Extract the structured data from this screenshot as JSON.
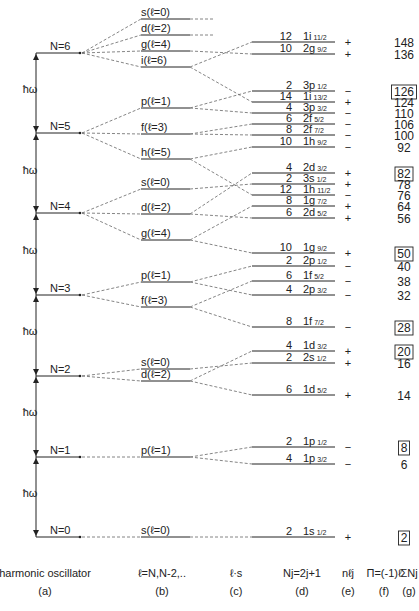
{
  "diagram": {
    "hbar_omega_label": "ħω",
    "oscillator_levels": [
      {
        "label": "N=6",
        "y": 53
      },
      {
        "label": "N=5",
        "y": 133
      },
      {
        "label": "N=4",
        "y": 213
      },
      {
        "label": "N=3",
        "y": 295
      },
      {
        "label": "N=2",
        "y": 376
      },
      {
        "label": "N=1",
        "y": 457
      },
      {
        "label": "N=0",
        "y": 537
      }
    ],
    "hbar_omega_label_positions": [
      93,
      174,
      254,
      335,
      416,
      497
    ],
    "l_levels": [
      {
        "N": 6,
        "label": "s(ℓ=0)",
        "y": 19
      },
      {
        "N": 6,
        "label": "d(ℓ=2)",
        "y": 35
      },
      {
        "N": 6,
        "label": "g(ℓ=4)",
        "y": 51
      },
      {
        "N": 6,
        "label": "i(ℓ=6)",
        "y": 67
      },
      {
        "N": 5,
        "label": "p(ℓ=1)",
        "y": 108
      },
      {
        "N": 5,
        "label": "f(ℓ=3)",
        "y": 134
      },
      {
        "N": 5,
        "label": "h(ℓ=5)",
        "y": 159
      },
      {
        "N": 4,
        "label": "s(ℓ=0)",
        "y": 189
      },
      {
        "N": 4,
        "label": "d(ℓ=2)",
        "y": 214
      },
      {
        "N": 4,
        "label": "g(ℓ=4)",
        "y": 240
      },
      {
        "N": 3,
        "label": "p(ℓ=1)",
        "y": 282
      },
      {
        "N": 3,
        "label": "f(ℓ=3)",
        "y": 307
      },
      {
        "N": 2,
        "label": "s(ℓ=0)",
        "y": 369
      },
      {
        "N": 2,
        "label": "d(ℓ=2)",
        "y": 381
      },
      {
        "N": 1,
        "label": "p(ℓ=1)",
        "y": 457
      },
      {
        "N": 0,
        "label": "s(ℓ=0)",
        "y": 537
      }
    ],
    "j_levels": [
      {
        "Nj": "12",
        "n": "1i",
        "j": "11/2",
        "parity": "+",
        "sum": "148",
        "magic": false,
        "y": 42,
        "from": 3
      },
      {
        "Nj": "10",
        "n": "2g",
        "j": "9/2",
        "parity": "+",
        "sum": "136",
        "magic": false,
        "y": 54,
        "from": 2
      },
      {
        "Nj": "2",
        "n": "3p",
        "j": "1/2",
        "parity": "−",
        "sum": "126",
        "magic": true,
        "y": 91,
        "from": 4
      },
      {
        "Nj": "14",
        "n": "1i",
        "j": "13/2",
        "parity": "+",
        "sum": "124",
        "magic": false,
        "y": 102,
        "from": 3
      },
      {
        "Nj": "4",
        "n": "3p",
        "j": "3/2",
        "parity": "−",
        "sum": "110",
        "magic": false,
        "y": 113,
        "from": 4
      },
      {
        "Nj": "6",
        "n": "2f",
        "j": "5/2",
        "parity": "−",
        "sum": "106",
        "magic": false,
        "y": 124,
        "from": 5
      },
      {
        "Nj": "8",
        "n": "2f",
        "j": "7/2",
        "parity": "−",
        "sum": "100",
        "magic": false,
        "y": 135,
        "from": 5
      },
      {
        "Nj": "10",
        "n": "1h",
        "j": "9/2",
        "parity": "−",
        "sum": "92",
        "magic": false,
        "y": 147,
        "from": 6
      },
      {
        "Nj": "4",
        "n": "2d",
        "j": "3/2",
        "parity": "+",
        "sum": "82",
        "magic": true,
        "y": 173,
        "from": 8
      },
      {
        "Nj": "2",
        "n": "3s",
        "j": "1/2",
        "parity": "+",
        "sum": "78",
        "magic": false,
        "y": 184,
        "from": 7
      },
      {
        "Nj": "12",
        "n": "1h",
        "j": "11/2",
        "parity": "−",
        "sum": "76",
        "magic": false,
        "y": 195,
        "from": 6
      },
      {
        "Nj": "8",
        "n": "1g",
        "j": "7/2",
        "parity": "+",
        "sum": "64",
        "magic": false,
        "y": 206,
        "from": 9
      },
      {
        "Nj": "6",
        "n": "2d",
        "j": "5/2",
        "parity": "+",
        "sum": "56",
        "magic": false,
        "y": 218,
        "from": 8
      },
      {
        "Nj": "10",
        "n": "1g",
        "j": "9/2",
        "parity": "+",
        "sum": "50",
        "magic": true,
        "y": 253,
        "from": 9
      },
      {
        "Nj": "2",
        "n": "2p",
        "j": "1/2",
        "parity": "−",
        "sum": "40",
        "magic": false,
        "y": 266,
        "from": 10
      },
      {
        "Nj": "6",
        "n": "1f",
        "j": "5/2",
        "parity": "−",
        "sum": "38",
        "magic": false,
        "y": 281,
        "from": 11
      },
      {
        "Nj": "4",
        "n": "2p",
        "j": "3/2",
        "parity": "−",
        "sum": "32",
        "magic": false,
        "y": 295,
        "from": 10
      },
      {
        "Nj": "8",
        "n": "1f",
        "j": "7/2",
        "parity": "−",
        "sum": "28",
        "magic": true,
        "y": 327,
        "from": 11
      },
      {
        "Nj": "4",
        "n": "1d",
        "j": "3/2",
        "parity": "+",
        "sum": "20",
        "magic": true,
        "y": 351,
        "from": 13
      },
      {
        "Nj": "2",
        "n": "2s",
        "j": "1/2",
        "parity": "+",
        "sum": "16",
        "magic": false,
        "y": 363,
        "from": 12
      },
      {
        "Nj": "6",
        "n": "1d",
        "j": "5/2",
        "parity": "+",
        "sum": "14",
        "magic": false,
        "y": 395,
        "from": 13
      },
      {
        "Nj": "2",
        "n": "1p",
        "j": "1/2",
        "parity": "−",
        "sum": "8",
        "magic": true,
        "y": 447,
        "from": 14
      },
      {
        "Nj": "4",
        "n": "1p",
        "j": "3/2",
        "parity": "−",
        "sum": "6",
        "magic": false,
        "y": 464,
        "from": 14
      },
      {
        "Nj": "2",
        "n": "1s",
        "j": "1/2",
        "parity": "+",
        "sum": "2",
        "magic": true,
        "y": 537,
        "from": 15
      }
    ],
    "top_unresolved_levels": [
      {
        "from": 0,
        "y": 19
      },
      {
        "from": 1,
        "y": 35
      }
    ]
  },
  "columns": [
    {
      "header": "harmonic oscillator",
      "key": "(a)",
      "x": 45
    },
    {
      "header": "ℓ=N,N-2,..",
      "key": "(b)",
      "x": 162
    },
    {
      "header": "ℓ·s",
      "key": "(c)",
      "x": 236
    },
    {
      "header": "Nj=2j+1",
      "key": "(d)",
      "x": 302
    },
    {
      "header": "nℓj",
      "key": "(e)",
      "x": 348
    },
    {
      "header": "Π=(-1)ℓ",
      "key": "(f)",
      "x": 384
    },
    {
      "header": "ΣNj",
      "key": "(g)",
      "x": 409
    }
  ],
  "colors": {
    "ink": "#222222",
    "background": "#ffffff",
    "dash": "#666666"
  }
}
